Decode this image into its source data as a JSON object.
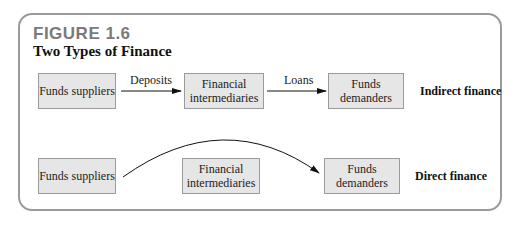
{
  "figure": {
    "label": "FIGURE 1.6",
    "title": "Two Types of Finance"
  },
  "indirect": {
    "suppliers": "Funds suppliers",
    "deposits": "Deposits",
    "intermediaries": "Financial intermediaries",
    "loans": "Loans",
    "demanders": "Funds demanders",
    "type_label": "Indirect finance"
  },
  "direct": {
    "suppliers": "Funds suppliers",
    "intermediaries": "Financial intermediaries",
    "demanders": "Funds demanders",
    "type_label": "Direct finance"
  },
  "colors": {
    "box_fill": "#e6e6e6",
    "frame": "#9a9a9a",
    "figure_label": "#7a7a7a"
  }
}
